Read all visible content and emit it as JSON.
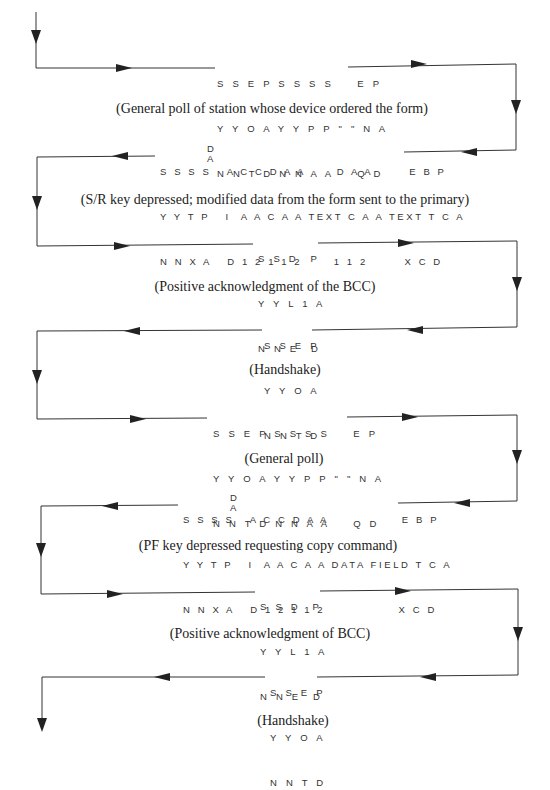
{
  "diagram": {
    "title": "",
    "exchanges": [
      {
        "id": "general-poll-1",
        "direction": "right",
        "rows": [
          "SSEPSSSS   EP",
          "YYOAYYPP\"\"NA",
          "NNTDNNAA   QD"
        ],
        "caption": "(General poll of station whose device ordered the form)"
      },
      {
        "id": "sr-key-data",
        "direction": "left",
        "rows": [
          "SSSS  ACCDAA      DAA       EBP",
          "YYTP   I AACAA TEXT CAA TEXT TCA",
          "NNXA   D12112       112        XCD"
        ],
        "da_label": "DA",
        "caption": "(S/R key depressed; modified data from the form sent to the primary)"
      },
      {
        "id": "positive-ack-1",
        "direction": "right",
        "rows": [
          "SSD P",
          "YYL1A",
          "NNE D"
        ],
        "caption": "(Positive acknowledgment of the BCC)"
      },
      {
        "id": "handshake-1",
        "direction": "left",
        "rows": [
          "SSEP",
          "YYOA",
          "NNTD"
        ],
        "caption": "(Handshake)"
      },
      {
        "id": "general-poll-2",
        "direction": "right",
        "rows": [
          "SSEPSSSS   EP",
          "YYOAYYPP\"\"NA",
          "NNTDNNAA   QD"
        ],
        "caption": "(General poll)"
      },
      {
        "id": "pf-key-copy",
        "direction": "left",
        "rows": [
          "SSSS  ACCDAA              EBP",
          "YYTP   I AACAA DATA FIELD TCA",
          "NNXA   D12112               XCD"
        ],
        "da_label": "DA",
        "caption": "(PF key depressed requesting copy command)"
      },
      {
        "id": "positive-ack-2",
        "direction": "right",
        "rows": [
          "SSD P",
          "YYL1A",
          "NNE D"
        ],
        "caption": "(Positive acknowledgment of BCC)"
      },
      {
        "id": "handshake-2",
        "direction": "left",
        "rows": [
          "SSEP",
          "YYOA",
          "NNTD"
        ],
        "caption": "(Handshake)"
      }
    ],
    "line_color": "#333333"
  },
  "blocks": {
    "b1": {
      "r1": "S S E P S S S S    E P",
      "r2": "Y Y O A Y Y P P \" \" N A",
      "r3": "N N T D N N A A    Q D"
    },
    "b2": {
      "r1": "S S S S   A C C D A A      D A A       E B P",
      "r2": "Y Y T P   I  A A C A A TEXT C A A TEXT T C A",
      "r3": "N N X A   D 1 2 1 1 2      1 1 2       X C D"
    },
    "b3": {
      "r1": "S S D  P",
      "r2": "Y Y L 1 A",
      "r3": "N N E  D"
    },
    "b4": {
      "r1": "S S E P",
      "r2": "Y Y O A",
      "r3": "N N T D"
    },
    "b5": {
      "r1": "S S E P S S S S    E P",
      "r2": "Y Y O A Y Y P P \" \" N A",
      "r3": "N N T D N N A A    Q D"
    },
    "b6": {
      "r1": "S S S S   A C C D A A              E B P",
      "r2": "Y Y T P   I  A A C A A DATA FIELD T C A",
      "r3": "N N X A   D 1 2 1 1 2              X C D"
    },
    "b7": {
      "r1": "S S D  P",
      "r2": "Y Y L 1 A",
      "r3": "N N E  D"
    },
    "b8": {
      "r1": "S S E P",
      "r2": "Y Y O A",
      "r3": "N N T D"
    },
    "da_top": "D",
    "da_bottom": "A"
  },
  "captions": {
    "c1": "(General poll of station whose device ordered the form)",
    "c2": "(S/R key depressed; modified data from the form sent to the primary)",
    "c3": "(Positive acknowledgment of the BCC)",
    "c4": "(Handshake)",
    "c5": "(General poll)",
    "c6": "(PF key depressed requesting copy command)",
    "c7": "(Positive acknowledgment of BCC)",
    "c8": "(Handshake)"
  }
}
